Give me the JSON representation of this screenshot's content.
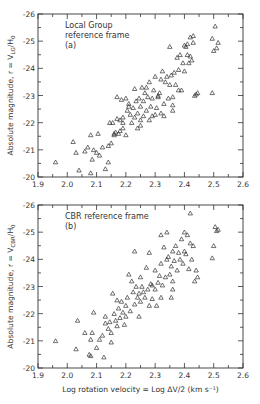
{
  "chart_data": [
    {
      "type": "scatter",
      "panel": "a",
      "annotation": [
        "Local Group",
        "reference frame",
        "(a)"
      ],
      "xlabel": "",
      "ylabel": "Absolute magnitude, r = V_LG/H0",
      "xlim": [
        1.9,
        2.6
      ],
      "ylim": [
        -20,
        -26
      ],
      "xticks": [
        "1.9",
        "2.0",
        "2.1",
        "2.2",
        "2.3",
        "2.4",
        "2.5",
        "2.6"
      ],
      "yticks": [
        "-20",
        "-21",
        "-22",
        "-23",
        "-24",
        "-25",
        "-26"
      ],
      "marker": "open-triangle",
      "grid": false,
      "points": [
        [
          1.96,
          -20.55
        ],
        [
          2.02,
          -21.3
        ],
        [
          2.03,
          -20.9
        ],
        [
          2.04,
          -20.25
        ],
        [
          2.06,
          -20.95
        ],
        [
          2.07,
          -21.1
        ],
        [
          2.08,
          -20.15
        ],
        [
          2.08,
          -21.55
        ],
        [
          2.085,
          -20.65
        ],
        [
          2.09,
          -21.0
        ],
        [
          2.1,
          -20.9
        ],
        [
          2.105,
          -21.6
        ],
        [
          2.11,
          -20.8
        ],
        [
          2.12,
          -21.1
        ],
        [
          2.13,
          -20.3
        ],
        [
          2.14,
          -20.55
        ],
        [
          2.145,
          -22.0
        ],
        [
          2.15,
          -21.25
        ],
        [
          2.155,
          -22.0
        ],
        [
          2.16,
          -21.55
        ],
        [
          2.16,
          -21.6
        ],
        [
          2.165,
          -21.65
        ],
        [
          2.17,
          -22.15
        ],
        [
          2.175,
          -21.6
        ],
        [
          2.18,
          -21.7
        ],
        [
          2.18,
          -22.1
        ],
        [
          2.185,
          -22.85
        ],
        [
          2.19,
          -21.8
        ],
        [
          2.19,
          -22.2
        ],
        [
          2.2,
          -21.55
        ],
        [
          2.2,
          -22.9
        ],
        [
          2.205,
          -22.45
        ],
        [
          2.21,
          -22.6
        ],
        [
          2.215,
          -22.3
        ],
        [
          2.22,
          -22.0
        ],
        [
          2.225,
          -22.55
        ],
        [
          2.23,
          -22.2
        ],
        [
          2.235,
          -22.8
        ],
        [
          2.24,
          -21.8
        ],
        [
          2.24,
          -22.35
        ],
        [
          2.245,
          -22.9
        ],
        [
          2.25,
          -22.1
        ],
        [
          2.25,
          -22.6
        ],
        [
          2.255,
          -23.3
        ],
        [
          2.26,
          -22.25
        ],
        [
          2.26,
          -22.8
        ],
        [
          2.265,
          -23.1
        ],
        [
          2.27,
          -22.45
        ],
        [
          2.27,
          -23.3
        ],
        [
          2.275,
          -22.95
        ],
        [
          2.28,
          -22.1
        ],
        [
          2.28,
          -23.5
        ],
        [
          2.285,
          -22.6
        ],
        [
          2.29,
          -22.25
        ],
        [
          2.29,
          -22.9
        ],
        [
          2.295,
          -23.2
        ],
        [
          2.3,
          -22.3
        ],
        [
          2.3,
          -23.7
        ],
        [
          2.305,
          -22.55
        ],
        [
          2.31,
          -23.0
        ],
        [
          2.31,
          -22.95
        ],
        [
          2.315,
          -23.1
        ],
        [
          2.32,
          -23.6
        ],
        [
          2.32,
          -22.35
        ],
        [
          2.325,
          -23.9
        ],
        [
          2.33,
          -22.7
        ],
        [
          2.335,
          -23.5
        ],
        [
          2.34,
          -23.7
        ],
        [
          2.345,
          -22.9
        ],
        [
          2.35,
          -23.4
        ],
        [
          2.355,
          -23.75
        ],
        [
          2.36,
          -22.65
        ],
        [
          2.36,
          -22.45
        ],
        [
          2.36,
          -22.95
        ],
        [
          2.365,
          -23.85
        ],
        [
          2.37,
          -23.4
        ],
        [
          2.375,
          -24.4
        ],
        [
          2.38,
          -23.2
        ],
        [
          2.38,
          -23.95
        ],
        [
          2.385,
          -24.5
        ],
        [
          2.39,
          -23.2
        ],
        [
          2.395,
          -24.2
        ],
        [
          2.4,
          -24.85
        ],
        [
          2.4,
          -23.9
        ],
        [
          2.405,
          -24.8
        ],
        [
          2.41,
          -24.5
        ],
        [
          2.41,
          -24.9
        ],
        [
          2.415,
          -24.2
        ],
        [
          2.42,
          -24.45
        ],
        [
          2.42,
          -25.15
        ],
        [
          2.425,
          -24.3
        ],
        [
          2.43,
          -25.2
        ],
        [
          2.43,
          -24.95
        ],
        [
          2.435,
          -23.0
        ],
        [
          2.44,
          -23.05
        ],
        [
          2.445,
          -23.1
        ],
        [
          2.35,
          -24.8
        ],
        [
          2.33,
          -22.25
        ],
        [
          2.21,
          -22.7
        ],
        [
          2.23,
          -23.25
        ],
        [
          2.495,
          -25.1
        ],
        [
          2.5,
          -24.65
        ],
        [
          2.505,
          -25.55
        ],
        [
          2.51,
          -24.75
        ],
        [
          2.515,
          -24.95
        ],
        [
          2.495,
          -23.1
        ],
        [
          2.17,
          -22.95
        ],
        [
          2.19,
          -22.0
        ],
        [
          2.25,
          -21.9
        ],
        [
          2.14,
          -21.15
        ]
      ]
    },
    {
      "type": "scatter",
      "panel": "b",
      "annotation": [
        "CBR reference frame",
        "(b)"
      ],
      "xlabel": "Log rotation velocity = Log ΔV/2 (km s⁻¹)",
      "ylabel": "Absolute magnitude, r = V_CBR/H0",
      "xlim": [
        1.9,
        2.6
      ],
      "ylim": [
        -20,
        -26
      ],
      "xticks": [
        "1.9",
        "2.0",
        "2.1",
        "2.2",
        "2.3",
        "2.4",
        "2.5",
        "2.6"
      ],
      "yticks": [
        "-20",
        "-21",
        "-22",
        "-23",
        "-24",
        "-25",
        "-26"
      ],
      "marker": "open-triangle",
      "grid": false,
      "points": [
        [
          1.96,
          -21.0
        ],
        [
          2.03,
          -20.7
        ],
        [
          2.035,
          -21.75
        ],
        [
          2.06,
          -21.3
        ],
        [
          2.075,
          -20.5
        ],
        [
          2.08,
          -21.05
        ],
        [
          2.08,
          -20.45
        ],
        [
          2.085,
          -21.3
        ],
        [
          2.09,
          -22.05
        ],
        [
          2.1,
          -20.75
        ],
        [
          2.11,
          -21.05
        ],
        [
          2.12,
          -21.2
        ],
        [
          2.125,
          -20.4
        ],
        [
          2.13,
          -21.65
        ],
        [
          2.14,
          -21.45
        ],
        [
          2.145,
          -21.7
        ],
        [
          2.15,
          -21.3
        ],
        [
          2.155,
          -22.75
        ],
        [
          2.16,
          -22.0
        ],
        [
          2.165,
          -21.75
        ],
        [
          2.17,
          -22.5
        ],
        [
          2.17,
          -21.55
        ],
        [
          2.175,
          -22.2
        ],
        [
          2.18,
          -21.85
        ],
        [
          2.185,
          -22.45
        ],
        [
          2.19,
          -22.05
        ],
        [
          2.195,
          -21.6
        ],
        [
          2.2,
          -22.3
        ],
        [
          2.2,
          -21.9
        ],
        [
          2.205,
          -22.6
        ],
        [
          2.21,
          -23.45
        ],
        [
          2.215,
          -22.1
        ],
        [
          2.22,
          -23.2
        ],
        [
          2.225,
          -22.8
        ],
        [
          2.23,
          -22.35
        ],
        [
          2.235,
          -23.0
        ],
        [
          2.24,
          -22.6
        ],
        [
          2.245,
          -22.75
        ],
        [
          2.25,
          -23.35
        ],
        [
          2.25,
          -22.45
        ],
        [
          2.255,
          -23.0
        ],
        [
          2.26,
          -22.8
        ],
        [
          2.265,
          -22.6
        ],
        [
          2.27,
          -23.7
        ],
        [
          2.275,
          -22.9
        ],
        [
          2.28,
          -22.3
        ],
        [
          2.285,
          -23.1
        ],
        [
          2.29,
          -23.05
        ],
        [
          2.29,
          -22.55
        ],
        [
          2.3,
          -22.9
        ],
        [
          2.3,
          -23.6
        ],
        [
          2.305,
          -22.3
        ],
        [
          2.31,
          -23.15
        ],
        [
          2.315,
          -23.4
        ],
        [
          2.32,
          -23.85
        ],
        [
          2.325,
          -23.05
        ],
        [
          2.33,
          -24.45
        ],
        [
          2.335,
          -23.35
        ],
        [
          2.34,
          -24.0
        ],
        [
          2.345,
          -24.1
        ],
        [
          2.35,
          -23.45
        ],
        [
          2.355,
          -23.75
        ],
        [
          2.36,
          -23.2
        ],
        [
          2.36,
          -24.3
        ],
        [
          2.36,
          -22.9
        ],
        [
          2.365,
          -23.95
        ],
        [
          2.37,
          -24.5
        ],
        [
          2.375,
          -23.6
        ],
        [
          2.38,
          -24.25
        ],
        [
          2.385,
          -24.0
        ],
        [
          2.39,
          -24.75
        ],
        [
          2.395,
          -23.85
        ],
        [
          2.4,
          -24.3
        ],
        [
          2.4,
          -25.0
        ],
        [
          2.405,
          -24.2
        ],
        [
          2.41,
          -24.9
        ],
        [
          2.415,
          -23.65
        ],
        [
          2.42,
          -24.6
        ],
        [
          2.42,
          -25.7
        ],
        [
          2.425,
          -24.0
        ],
        [
          2.43,
          -24.5
        ],
        [
          2.435,
          -23.2
        ],
        [
          2.44,
          -23.6
        ],
        [
          2.445,
          -23.35
        ],
        [
          2.34,
          -25.0
        ],
        [
          2.32,
          -24.9
        ],
        [
          2.28,
          -24.25
        ],
        [
          2.23,
          -24.3
        ],
        [
          2.495,
          -24.05
        ],
        [
          2.5,
          -24.5
        ],
        [
          2.505,
          -25.2
        ],
        [
          2.51,
          -25.05
        ],
        [
          2.515,
          -25.1
        ],
        [
          2.15,
          -20.95
        ],
        [
          2.13,
          -21.9
        ],
        [
          2.245,
          -21.9
        ],
        [
          2.355,
          -22.6
        ],
        [
          2.32,
          -22.6
        ]
      ]
    }
  ]
}
